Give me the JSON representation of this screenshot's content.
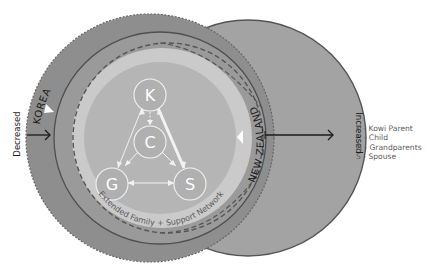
{
  "diagram": {
    "regions": {
      "left_label": "KOREA",
      "right_label": "NEW ZEALAND",
      "inner_label": "Extended Family + Support Network"
    },
    "axis": {
      "left_label": "Decreased",
      "right_label": "Increased"
    },
    "nodes": [
      {
        "id": "K",
        "label": "K"
      },
      {
        "id": "C",
        "label": "C"
      },
      {
        "id": "G",
        "label": "G"
      },
      {
        "id": "S",
        "label": "S"
      }
    ],
    "legend": [
      {
        "key": "K",
        "text": "K - Kowi Parent"
      },
      {
        "key": "C",
        "text": "C - Child"
      },
      {
        "key": "G",
        "text": "G - Grandparents"
      },
      {
        "key": "S",
        "text": "S - Spouse"
      }
    ],
    "colors": {
      "nz_circle": "#a3a3a3",
      "korea_outer": "#8e8e8e",
      "korea_inner": "#9a9a9a",
      "inner_ring": "#c9c9c9",
      "inner_disk": "#b4b4b4",
      "stroke": "#555555",
      "node": "#ffffff"
    }
  }
}
